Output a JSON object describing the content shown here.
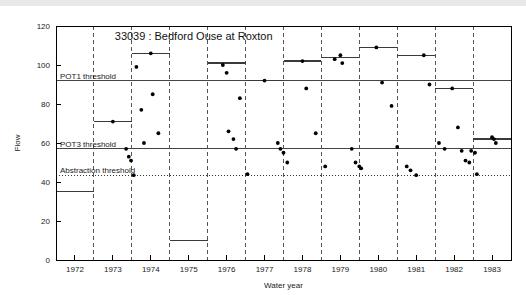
{
  "chart_data": {
    "type": "scatter",
    "title": "33039 : Bedford Ouse at Roxton",
    "xlabel": "Water year",
    "ylabel": "Flow",
    "xlim": [
      1971.5,
      1983.5
    ],
    "ylim": [
      0,
      120
    ],
    "grid": "vertical dashed year dividers at mid-year boundaries",
    "legend": "none",
    "y_ticks": [
      0,
      20,
      40,
      60,
      80,
      100,
      120
    ],
    "y_tick_labels": [
      "0",
      "20",
      "40",
      "60",
      "80",
      "100",
      "120"
    ],
    "x_ticks": [
      1972,
      1973,
      1974,
      1975,
      1976,
      1977,
      1978,
      1979,
      1980,
      1981,
      1982,
      1983
    ],
    "x_tick_labels": [
      "1972",
      "1973",
      "1974",
      "1975",
      "1976",
      "1977",
      "1978",
      "1979",
      "1980",
      "1981",
      "1982",
      "1983"
    ],
    "thresholds": [
      {
        "name": "POT1 threshold",
        "label": "POT1 threshold",
        "value": 92,
        "style": "solid"
      },
      {
        "name": "POT3 threshold",
        "label": "POT3 threshold",
        "value": 57,
        "style": "solid"
      },
      {
        "name": "Abstraction threshold",
        "label": "Abstraction threshold",
        "value": 43.5,
        "style": "dotted"
      }
    ],
    "annual_step_levels": [
      {
        "year": 1972,
        "value": 35
      },
      {
        "year": 1973,
        "value": 71
      },
      {
        "year": 1974,
        "value": 106
      },
      {
        "year": 1975,
        "value": 10
      },
      {
        "year": 1976,
        "value": 101
      },
      {
        "year": 1977,
        "value": 92
      },
      {
        "year": 1978,
        "value": 102
      },
      {
        "year": 1979,
        "value": 104
      },
      {
        "year": 1980,
        "value": 109
      },
      {
        "year": 1981,
        "value": 105
      },
      {
        "year": 1982,
        "value": 88
      },
      {
        "year": 1983,
        "value": 62
      }
    ],
    "points": [
      {
        "x": 1973.0,
        "y": 71
      },
      {
        "x": 1973.35,
        "y": 57
      },
      {
        "x": 1973.42,
        "y": 53
      },
      {
        "x": 1973.48,
        "y": 51
      },
      {
        "x": 1973.55,
        "y": 43.5
      },
      {
        "x": 1973.62,
        "y": 99
      },
      {
        "x": 1973.75,
        "y": 77
      },
      {
        "x": 1973.82,
        "y": 60
      },
      {
        "x": 1974.0,
        "y": 106
      },
      {
        "x": 1974.05,
        "y": 85
      },
      {
        "x": 1974.2,
        "y": 65
      },
      {
        "x": 1975.9,
        "y": 100
      },
      {
        "x": 1976.0,
        "y": 96
      },
      {
        "x": 1976.05,
        "y": 66
      },
      {
        "x": 1976.18,
        "y": 62
      },
      {
        "x": 1976.25,
        "y": 57
      },
      {
        "x": 1976.35,
        "y": 83
      },
      {
        "x": 1976.55,
        "y": 44
      },
      {
        "x": 1977.0,
        "y": 92
      },
      {
        "x": 1977.35,
        "y": 60
      },
      {
        "x": 1977.42,
        "y": 57
      },
      {
        "x": 1977.5,
        "y": 55
      },
      {
        "x": 1977.6,
        "y": 50
      },
      {
        "x": 1978.0,
        "y": 102
      },
      {
        "x": 1978.1,
        "y": 88
      },
      {
        "x": 1978.35,
        "y": 65
      },
      {
        "x": 1978.6,
        "y": 48
      },
      {
        "x": 1978.85,
        "y": 103
      },
      {
        "x": 1979.0,
        "y": 105
      },
      {
        "x": 1979.05,
        "y": 101
      },
      {
        "x": 1979.3,
        "y": 57
      },
      {
        "x": 1979.4,
        "y": 50
      },
      {
        "x": 1979.5,
        "y": 48
      },
      {
        "x": 1979.55,
        "y": 47
      },
      {
        "x": 1979.95,
        "y": 109
      },
      {
        "x": 1980.1,
        "y": 91
      },
      {
        "x": 1980.35,
        "y": 79
      },
      {
        "x": 1980.5,
        "y": 58
      },
      {
        "x": 1980.75,
        "y": 48
      },
      {
        "x": 1980.85,
        "y": 46
      },
      {
        "x": 1981.0,
        "y": 43.5
      },
      {
        "x": 1981.2,
        "y": 105
      },
      {
        "x": 1981.35,
        "y": 90
      },
      {
        "x": 1981.6,
        "y": 60
      },
      {
        "x": 1981.75,
        "y": 57
      },
      {
        "x": 1981.95,
        "y": 88
      },
      {
        "x": 1982.1,
        "y": 68
      },
      {
        "x": 1982.2,
        "y": 56
      },
      {
        "x": 1982.3,
        "y": 51
      },
      {
        "x": 1982.4,
        "y": 50
      },
      {
        "x": 1982.45,
        "y": 56
      },
      {
        "x": 1982.55,
        "y": 55
      },
      {
        "x": 1982.6,
        "y": 44
      },
      {
        "x": 1983.0,
        "y": 63
      },
      {
        "x": 1983.05,
        "y": 62
      },
      {
        "x": 1983.1,
        "y": 60
      }
    ]
  },
  "colors": {
    "point": "#000000",
    "threshold": "#444444",
    "divider": "#555555",
    "axis": "#000000",
    "background": "#ffffff"
  }
}
